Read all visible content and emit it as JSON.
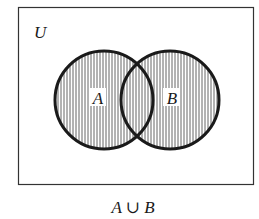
{
  "diagram": {
    "type": "venn",
    "universe_label": "U",
    "sets": [
      {
        "label": "A",
        "cx": 104,
        "cy": 100,
        "r": 49
      },
      {
        "label": "B",
        "cx": 170,
        "cy": 100,
        "r": 49
      }
    ],
    "shaded_region": "A ∪ B",
    "hatch": "vertical",
    "caption": "A ∪ B"
  },
  "colors": {
    "stroke": "#1a1a1a",
    "hatch": "#555555",
    "background": "#ffffff"
  }
}
